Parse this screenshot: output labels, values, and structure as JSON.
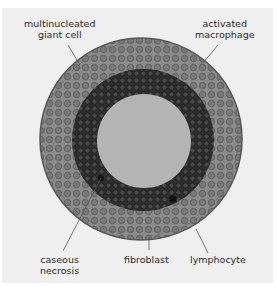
{
  "diagram": {
    "colors": {
      "background": "#efefef",
      "outer_layer": "#8a8a8a",
      "lymphocyte_ring": "#3a3a3a",
      "necrosis_core": "#b4b4b4",
      "leader_line": "#555555"
    },
    "labels": {
      "multinucleated_giant_cell": [
        "multinucleated",
        "giant cell"
      ],
      "activated_macrophage": [
        "activated",
        "macrophage"
      ],
      "caseous_necrosis": [
        "caseous",
        "necrosis"
      ],
      "fibroblast": "fibroblast",
      "lymphocyte": "lymphocyte"
    }
  }
}
